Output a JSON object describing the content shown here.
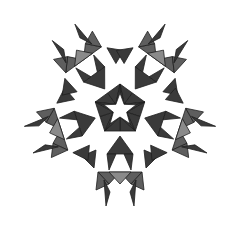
{
  "figure": {
    "center": [
      120,
      110
    ],
    "arm_angles_deg": [
      180,
      252,
      324,
      36,
      108
    ],
    "colors": {
      "background": "#ffffff",
      "dark": "#3a3a3a",
      "mid": "#5e5e5e",
      "light": "#8a8a8a",
      "star": "#ffffff",
      "stroke": "#1e1e1e"
    },
    "core": {
      "star_outer_radius": 17,
      "star_inner_radius": 7,
      "ring_radius": 26
    },
    "arm_triangles": [
      {
        "pts": [
          [
            0,
            26
          ],
          [
            -13,
            44
          ],
          [
            13,
            44
          ]
        ],
        "shade": "dark"
      },
      {
        "pts": [
          [
            -13,
            44
          ],
          [
            -4,
            44
          ],
          [
            -11,
            60
          ]
        ],
        "shade": "dark"
      },
      {
        "pts": [
          [
            13,
            44
          ],
          [
            4,
            44
          ],
          [
            11,
            60
          ]
        ],
        "shade": "dark"
      },
      {
        "pts": [
          [
            -22,
            62
          ],
          [
            0,
            62
          ],
          [
            -11,
            74
          ]
        ],
        "shade": "mid"
      },
      {
        "pts": [
          [
            0,
            62
          ],
          [
            22,
            62
          ],
          [
            11,
            74
          ]
        ],
        "shade": "mid"
      },
      {
        "pts": [
          [
            -11,
            62
          ],
          [
            11,
            62
          ],
          [
            0,
            74
          ]
        ],
        "shade": "light"
      },
      {
        "pts": [
          [
            -22,
            62
          ],
          [
            -11,
            74
          ],
          [
            -24,
            80
          ]
        ],
        "shade": "mid"
      },
      {
        "pts": [
          [
            22,
            62
          ],
          [
            11,
            74
          ],
          [
            24,
            80
          ]
        ],
        "shade": "mid"
      },
      {
        "pts": [
          [
            -16,
            70
          ],
          [
            -10,
            82
          ],
          [
            -14,
            96
          ]
        ],
        "shade": "dark"
      },
      {
        "pts": [
          [
            16,
            70
          ],
          [
            10,
            82
          ],
          [
            14,
            96
          ]
        ],
        "shade": "dark"
      }
    ],
    "side_flags": [
      {
        "pts": [
          [
            -24,
            40
          ],
          [
            -38,
            46
          ],
          [
            -26,
            58
          ]
        ],
        "shade": "dark"
      },
      {
        "pts": [
          [
            24,
            40
          ],
          [
            38,
            46
          ],
          [
            26,
            58
          ]
        ],
        "shade": "dark"
      }
    ]
  }
}
